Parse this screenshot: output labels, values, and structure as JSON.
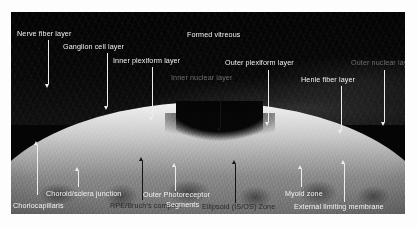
{
  "figure": {
    "kind": "oct-retinal-cross-section",
    "caption": "",
    "colors": {
      "light_label": "#f2f2f2",
      "grey_label": "#6f6f6f",
      "dark_label": "#2a2a2a",
      "background": "#ffffff",
      "scan_background": "#050505"
    }
  },
  "annotations": [
    {
      "id": "nerve-fiber-layer",
      "label": "Nerve fiber layer",
      "tone": "light",
      "arrow": "down"
    },
    {
      "id": "ganglion-cell-layer",
      "label": "Ganglion cell layer",
      "tone": "light",
      "arrow": "down"
    },
    {
      "id": "inner-plexiform-layer",
      "label": "Inner plexiform layer",
      "tone": "light",
      "arrow": "down"
    },
    {
      "id": "inner-nuclear-layer",
      "label": "Inner nuclear layer",
      "tone": "grey",
      "arrow": "down"
    },
    {
      "id": "formed-vitreous",
      "label": "Formed vitreous",
      "tone": "light",
      "arrow": "none"
    },
    {
      "id": "outer-plexiform-layer",
      "label": "Outer plexiform layer",
      "tone": "light",
      "arrow": "down"
    },
    {
      "id": "outer-nuclear-layer",
      "label": "Outer nuclear layer",
      "tone": "grey",
      "arrow": "down"
    },
    {
      "id": "henle-fiber-layer",
      "label": "Henle fiber layer",
      "tone": "light",
      "arrow": "down"
    },
    {
      "id": "choroid-sclera-junction",
      "label": "Choroid/sclera junction",
      "tone": "light",
      "arrow": "up"
    },
    {
      "id": "choriocapillaris",
      "label": "Choriocapillaris",
      "tone": "light",
      "arrow": "up"
    },
    {
      "id": "rpe-bruchs-complex",
      "label": "RPE/Bruch's complex",
      "tone": "dark",
      "arrow": "up"
    },
    {
      "id": "outer-photoreceptor-segments",
      "label": "Outer Photoreceptor",
      "label2": "Segments",
      "tone": "light",
      "arrow": "up"
    },
    {
      "id": "ellipsoid-isos-zone",
      "label": "Ellipsoid (IS/OS) Zone",
      "tone": "dark",
      "arrow": "up"
    },
    {
      "id": "myoid-zone",
      "label": "Myoid zone",
      "tone": "light",
      "arrow": "up"
    },
    {
      "id": "external-limiting-membrane",
      "label": "External limiting membrane",
      "tone": "light",
      "arrow": "up"
    }
  ]
}
